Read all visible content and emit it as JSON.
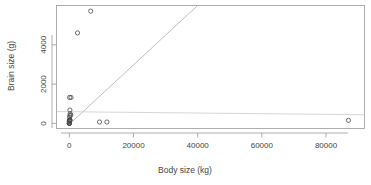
{
  "chart_data": {
    "type": "scatter",
    "title": "",
    "xlabel": "Body size (kg)",
    "ylabel": "Brain size (g)",
    "xlim": [
      -4000,
      92000
    ],
    "ylim": [
      -260,
      6000
    ],
    "xticks": [
      0,
      20000,
      40000,
      60000,
      80000
    ],
    "xtick_labels": [
      "0",
      "20000",
      "40000",
      "60000",
      "80000"
    ],
    "yticks": [
      0,
      2000,
      4000
    ],
    "ytick_labels": [
      "0",
      "2000",
      "4000"
    ],
    "grid": false,
    "legend": false,
    "points": [
      {
        "x": 6654,
        "y": 5712
      },
      {
        "x": 2547,
        "y": 4603
      },
      {
        "x": 521,
        "y": 1320
      },
      {
        "x": 187,
        "y": 680
      },
      {
        "x": 465,
        "y": 423
      },
      {
        "x": 207,
        "y": 406
      },
      {
        "x": 62,
        "y": 1320
      },
      {
        "x": 250,
        "y": 490
      },
      {
        "x": 120,
        "y": 175
      },
      {
        "x": 85,
        "y": 325
      },
      {
        "x": 160,
        "y": 169
      },
      {
        "x": 35,
        "y": 157
      },
      {
        "x": 28,
        "y": 115
      },
      {
        "x": 55,
        "y": 100
      },
      {
        "x": 10,
        "y": 115
      },
      {
        "x": 3,
        "y": 25
      },
      {
        "x": 1,
        "y": 12
      },
      {
        "x": 0.4,
        "y": 5
      },
      {
        "x": 0.1,
        "y": 1
      },
      {
        "x": 192,
        "y": 180
      },
      {
        "x": 100,
        "y": 157
      },
      {
        "x": 2,
        "y": 12
      },
      {
        "x": 9400,
        "y": 70
      },
      {
        "x": 11700,
        "y": 70
      },
      {
        "x": 87000,
        "y": 155
      }
    ],
    "lines": [
      {
        "name": "regression-line",
        "x0": 300,
        "y0": 0,
        "x1": 40000,
        "y1": 6000
      },
      {
        "name": "reference-line",
        "x0": -4000,
        "y0": 600,
        "x1": 92000,
        "y1": 440
      }
    ]
  }
}
